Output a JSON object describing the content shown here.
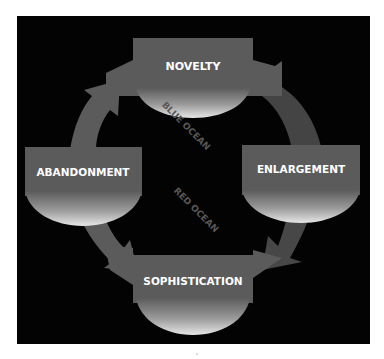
{
  "diagram": {
    "type": "cycle",
    "stages": [
      {
        "id": "novelty",
        "label": "NOVELTY"
      },
      {
        "id": "enlargement",
        "label": "ENLARGEMENT"
      },
      {
        "id": "sophistication",
        "label": "SOPHISTICATION"
      },
      {
        "id": "abandonment",
        "label": "ABANDONMENT"
      }
    ],
    "flow": [
      "NOVELTY",
      "ENLARGEMENT",
      "SOPHISTICATION",
      "ABANDONMENT",
      "NOVELTY"
    ],
    "zones": [
      {
        "id": "blue-ocean",
        "label": "BLUE OCEAN"
      },
      {
        "id": "red-ocean",
        "label": "RED OCEAN"
      }
    ]
  },
  "colors": {
    "background": "#030303",
    "box": "#5b5b5b",
    "arc": "#444444",
    "label": "#ffffff",
    "zone_text": "#555555"
  }
}
